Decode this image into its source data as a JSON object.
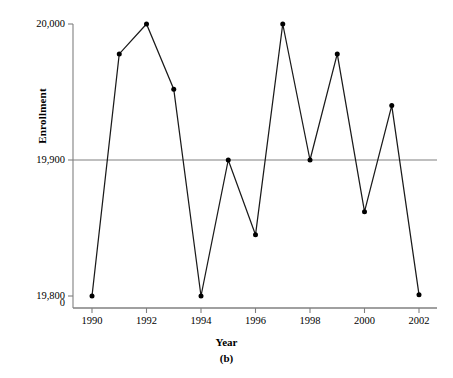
{
  "chart_data": {
    "type": "line",
    "title": "",
    "subtitle": "",
    "panel_label": "(b)",
    "xlabel": "Year",
    "ylabel": "Enrollment",
    "x": [
      1990,
      1991,
      1992,
      1993,
      1994,
      1995,
      1996,
      1997,
      1998,
      1999,
      2000,
      2001,
      2002
    ],
    "values": [
      19800,
      19978,
      20000,
      19952,
      19800,
      19900,
      19845,
      20000,
      19900,
      19978,
      19862,
      19940,
      19801
    ],
    "series": [
      {
        "name": "Enrollment",
        "values": [
          19800,
          19978,
          20000,
          19952,
          19800,
          19900,
          19845,
          20000,
          19900,
          19978,
          19862,
          19940,
          19801
        ]
      }
    ],
    "ylim": [
      19780,
      20010
    ],
    "xlim": [
      1989.4,
      2002.6
    ],
    "yticks": [
      19800,
      19900,
      20000
    ],
    "ytick_labels": [
      "19,800",
      "19,900",
      "20,000"
    ],
    "y_origin_label": "0",
    "xticks": [
      1990,
      1992,
      1994,
      1996,
      1998,
      2000,
      2002
    ],
    "xtick_labels": [
      "1990",
      "1992",
      "1994",
      "1996",
      "1998",
      "2000",
      "2002"
    ],
    "grid": false,
    "legend": "none",
    "reference_line": {
      "label": "19,900 reference line",
      "value": 19900,
      "color": "#808080"
    },
    "marker": "filled-circle",
    "line_color": "#1a1a1a",
    "marker_color": "#000000",
    "axis_color": "#808080",
    "background_color": "#ffffff"
  },
  "figure": {
    "y_axis_title": "Enrollment",
    "x_axis_title": "Year",
    "caption": "(b)"
  },
  "footer": {
    "note": ""
  }
}
